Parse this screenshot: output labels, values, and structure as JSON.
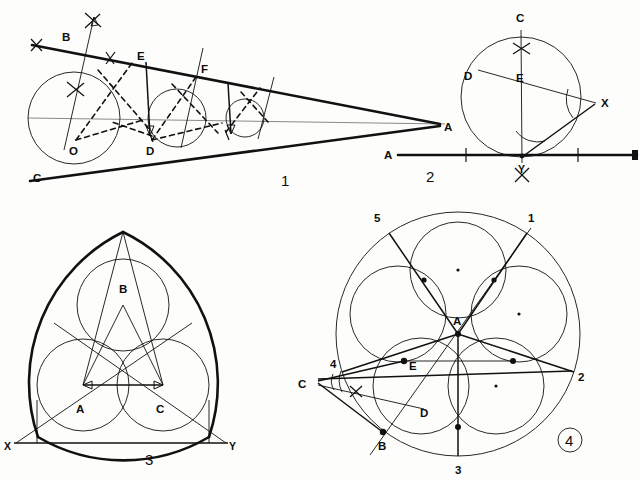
{
  "plate": {
    "title": "Geometric constructions plate",
    "background_color": "#fdfdfc",
    "ink_color": "#111111",
    "figure_count": 4
  },
  "figures": [
    {
      "id": "figure-1",
      "number_label": "1",
      "caption_position": {
        "x": 281,
        "y": 186
      },
      "description": "Chain of inscribed circles in a wedge between two tangent lines meeting at apex A",
      "points": [
        {
          "name": "B",
          "label": "B",
          "x": 66,
          "y": 37,
          "lx": 66,
          "ly": 37
        },
        {
          "name": "C",
          "label": "C",
          "x": 37,
          "y": 177,
          "lx": 37,
          "ly": 177
        },
        {
          "name": "E",
          "label": "E",
          "x": 141,
          "y": 56,
          "lx": 141,
          "ly": 56
        },
        {
          "name": "F",
          "label": "F",
          "x": 205,
          "y": 69,
          "lx": 205,
          "ly": 69
        },
        {
          "name": "O",
          "label": "O",
          "x": 74,
          "y": 140,
          "lx": 74,
          "ly": 140
        },
        {
          "name": "D",
          "label": "D",
          "x": 152,
          "y": 140,
          "lx": 152,
          "ly": 140
        },
        {
          "name": "A",
          "label": "A",
          "x": 440,
          "y": 126,
          "lx": 440,
          "ly": 126
        }
      ],
      "circles": [
        {
          "name": "circle-large",
          "cx": 74,
          "cy": 118,
          "r": 46
        },
        {
          "name": "circle-medium",
          "cx": 177,
          "cy": 118,
          "r": 29
        },
        {
          "name": "circle-small",
          "cx": 245,
          "cy": 118,
          "r": 19
        }
      ]
    },
    {
      "id": "figure-2",
      "number_label": "2",
      "caption_position": {
        "x": 432,
        "y": 179
      },
      "description": "Circle through Y with angle construction at Y, chord to X, diameter D-X and perpendicular bisector C-Y",
      "points": [
        {
          "name": "C",
          "label": "C",
          "x": 520,
          "y": 23,
          "lx": 520,
          "ly": 23
        },
        {
          "name": "D",
          "label": "D",
          "x": 470,
          "y": 76,
          "lx": 470,
          "ly": 76
        },
        {
          "name": "E",
          "label": "E",
          "x": 521,
          "y": 78,
          "lx": 521,
          "ly": 78
        },
        {
          "name": "X",
          "label": "X",
          "x": 599,
          "y": 103,
          "lx": 599,
          "ly": 103
        },
        {
          "name": "Y",
          "label": "Y",
          "x": 522,
          "y": 163,
          "lx": 522,
          "ly": 163
        },
        {
          "name": "A",
          "label": "A",
          "x": 390,
          "y": 155,
          "lx": 390,
          "ly": 155
        }
      ],
      "circles": [
        {
          "name": "main-circle",
          "cx": 521,
          "cy": 97,
          "r": 60
        }
      ],
      "baseline": {
        "name": "line-A-B",
        "x1": 396,
        "y1": 155,
        "x2": 639,
        "y2": 155
      }
    },
    {
      "id": "figure-3",
      "number_label": "3",
      "caption_position": {
        "x": 150,
        "y": 459
      },
      "description": "Reuleaux-like triangle with three inscribed circles, centers A, B, C on base line X-Y",
      "points": [
        {
          "name": "B",
          "label": "B",
          "x": 124,
          "y": 298,
          "lx": 124,
          "ly": 298
        },
        {
          "name": "A",
          "label": "A",
          "x": 82,
          "y": 408,
          "lx": 82,
          "ly": 408
        },
        {
          "name": "C",
          "label": "C",
          "x": 162,
          "y": 408,
          "lx": 162,
          "ly": 408
        },
        {
          "name": "X",
          "label": "X",
          "x": 8,
          "y": 447,
          "lx": 8,
          "ly": 447
        },
        {
          "name": "Y",
          "label": "Y",
          "x": 232,
          "y": 447,
          "lx": 232,
          "ly": 447
        }
      ],
      "circles": [
        {
          "name": "circle-top",
          "cx": 123,
          "cy": 305,
          "r": 46
        },
        {
          "name": "circle-bottom-left",
          "cx": 83,
          "cy": 385,
          "r": 46
        },
        {
          "name": "circle-bottom-right",
          "cx": 163,
          "cy": 385,
          "r": 46
        }
      ],
      "baseline": {
        "name": "line-X-Y",
        "x1": 14,
        "y1": 443,
        "x2": 228,
        "y2": 443
      }
    },
    {
      "id": "figure-4",
      "number_label": "4",
      "number_circled": true,
      "caption_position": {
        "x": 566,
        "y": 444
      },
      "description": "Pentagonal rosette: five overlapping circles inside a large circle, radii from center A to numbered points 1-5, with angle construction at external point C",
      "points": [
        {
          "name": "A",
          "label": "A",
          "x": 458,
          "y": 320,
          "lx": 458,
          "ly": 320
        },
        {
          "name": "B",
          "label": "B",
          "x": 382,
          "y": 437,
          "lx": 382,
          "ly": 437
        },
        {
          "name": "C",
          "label": "C",
          "x": 305,
          "y": 383,
          "lx": 305,
          "ly": 383
        },
        {
          "name": "D",
          "label": "D",
          "x": 424,
          "y": 409,
          "lx": 424,
          "ly": 409
        },
        {
          "name": "E",
          "label": "E",
          "x": 404,
          "y": 364,
          "lx": 404,
          "ly": 364
        }
      ],
      "numbered_vertices": [
        {
          "label": "1",
          "x": 531,
          "y": 219
        },
        {
          "label": "2",
          "x": 581,
          "y": 377
        },
        {
          "label": "3",
          "x": 459,
          "y": 470
        },
        {
          "label": "4",
          "x": 334,
          "y": 364
        },
        {
          "label": "5",
          "x": 378,
          "y": 219
        }
      ],
      "circles": [
        {
          "name": "outer-circle",
          "cx": 458,
          "cy": 334,
          "r": 122
        },
        {
          "name": "petal-1",
          "cx": 458,
          "cy": 270,
          "r": 48
        },
        {
          "name": "petal-2",
          "cx": 519,
          "cy": 314,
          "r": 48
        },
        {
          "name": "petal-3",
          "cx": 496,
          "cy": 386,
          "r": 48
        },
        {
          "name": "petal-4",
          "cx": 421,
          "cy": 386,
          "r": 48
        },
        {
          "name": "petal-5",
          "cx": 398,
          "cy": 314,
          "r": 48
        }
      ]
    }
  ],
  "labels": {
    "figure1_number": "1",
    "figure2_number": "2",
    "figure3_number": "3",
    "figure4_number": "4",
    "fig1_B": "B",
    "fig1_C": "C",
    "fig1_E": "E",
    "fig1_F": "F",
    "fig1_O": "O",
    "fig1_D": "D",
    "fig1_A": "A",
    "fig2_C": "C",
    "fig2_D": "D",
    "fig2_E": "E",
    "fig2_X": "X",
    "fig2_Y": "Y",
    "fig2_A": "A",
    "fig3_B": "B",
    "fig3_A": "A",
    "fig3_C": "C",
    "fig3_X": "X",
    "fig3_Y": "Y",
    "fig4_A": "A",
    "fig4_B": "B",
    "fig4_C": "C",
    "fig4_D": "D",
    "fig4_E": "E",
    "fig4_v1": "1",
    "fig4_v2": "2",
    "fig4_v3": "3",
    "fig4_v4": "4",
    "fig4_v5": "5"
  }
}
